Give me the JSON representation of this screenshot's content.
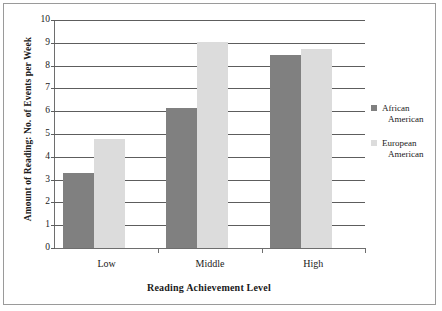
{
  "chart_data": {
    "type": "bar",
    "title": "",
    "xlabel": "Reading Achievement Level",
    "ylabel": "Amount of Reading: No. of Events per Week",
    "categories": [
      "Low",
      "Middle",
      "High"
    ],
    "series": [
      {
        "name": "African American",
        "name_line1": "African",
        "name_line2": "American",
        "color": "#808080",
        "values": [
          3.3,
          6.15,
          8.45
        ]
      },
      {
        "name": "European American",
        "name_line1": "European",
        "name_line2": "American",
        "color": "#dcdcdc",
        "values": [
          4.8,
          9.05,
          8.75
        ]
      }
    ],
    "ylim": [
      0,
      10
    ],
    "ytick_labels": [
      "0",
      "1",
      "2",
      "3",
      "4",
      "5",
      "6",
      "7",
      "8",
      "9",
      "10"
    ],
    "ytick_values": [
      0,
      1,
      2,
      3,
      4,
      5,
      6,
      7,
      8,
      9,
      10
    ],
    "grid": true,
    "legend_position": "right",
    "axis_color": "#5d5d5d",
    "frame_color": "#9a9a9a",
    "background": "#ffffff"
  }
}
